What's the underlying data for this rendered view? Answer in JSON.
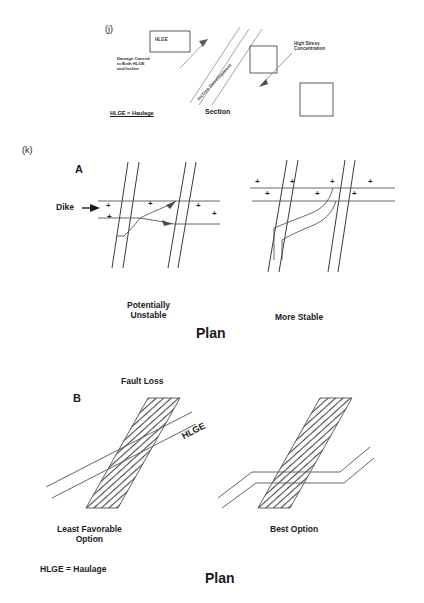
{
  "figure": {
    "panel_j": {
      "tag": "(j)",
      "hlge_box_label": "HLGE",
      "damage_note": "Damage Caused\nto Both HLGE\nand Incline",
      "incline_label": "Incline Development",
      "stress_note": "High Stress\nConcentration",
      "legend": "HLGE = Haulage",
      "view_label": "Section"
    },
    "panel_k": {
      "tag": "(k)",
      "section_a": {
        "letter": "A",
        "dike_label": "Dike",
        "left_caption": "Potentially\nUnstable",
        "right_caption": "More Stable",
        "view_label": "Plan",
        "plus_marks_left": 5,
        "plus_marks_right": 7
      },
      "section_b": {
        "letter": "B",
        "fault_label": "Fault Loss",
        "hlge_label": "HLGE",
        "left_caption": "Least Favorable\nOption",
        "right_caption": "Best Option",
        "legend": "HLGE = Haulage",
        "view_label": "Plan"
      }
    },
    "colors": {
      "ink": "#1b1b1b",
      "line": "#555555",
      "hatch": "#4a4a4a",
      "background": "#ffffff"
    }
  }
}
